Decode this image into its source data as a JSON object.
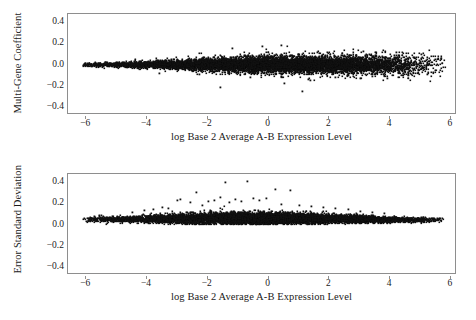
{
  "figure": {
    "background": "#ffffff",
    "point_color": "#111111",
    "axis_color": "#8e8e8e"
  },
  "chart_data": [
    {
      "type": "scatter",
      "panel": "top",
      "title": "",
      "xlabel": "log Base 2 Average A-B Expression Level",
      "ylabel": "Multi-Gene Coefficient",
      "xlim": [
        -6.6,
        6.2
      ],
      "ylim": [
        -0.47,
        0.47
      ],
      "xticks": [
        -6,
        -4,
        -2,
        0,
        2,
        4,
        6
      ],
      "xticklabels": [
        "−6",
        "−4",
        "−2",
        "0",
        "2",
        "4",
        "6"
      ],
      "yticks": [
        -0.4,
        -0.2,
        0.0,
        0.2,
        0.4
      ],
      "yticklabels": [
        "−0.4",
        "−0.2",
        "0.0",
        "0.2",
        "0.4"
      ],
      "grid": false,
      "legend": false,
      "n_points": 9000,
      "description": "Dense horizontal cloud centred on y = 0, narrow at the left (x = -6) and broadening toward the middle and right; scatter spreads to roughly +/-0.15 near x = 1-4 with sparse outliers reaching -0.25 and +0.2.",
      "density_profile": {
        "x_min_data": -6.1,
        "x_max_data": 5.8,
        "center": 0.0,
        "spread_by_x": [
          {
            "x": -6.0,
            "sd": 0.009
          },
          {
            "x": -5.0,
            "sd": 0.012
          },
          {
            "x": -4.0,
            "sd": 0.016
          },
          {
            "x": -3.0,
            "sd": 0.021
          },
          {
            "x": -2.0,
            "sd": 0.028
          },
          {
            "x": -1.0,
            "sd": 0.034
          },
          {
            "x": 0.0,
            "sd": 0.038
          },
          {
            "x": 1.0,
            "sd": 0.04
          },
          {
            "x": 2.0,
            "sd": 0.041
          },
          {
            "x": 3.0,
            "sd": 0.042
          },
          {
            "x": 4.0,
            "sd": 0.046
          },
          {
            "x": 5.0,
            "sd": 0.05
          },
          {
            "x": 5.8,
            "sd": 0.052
          }
        ],
        "x_weight_by_x": [
          {
            "x": -6.0,
            "w": 0.1
          },
          {
            "x": -5.0,
            "w": 0.22
          },
          {
            "x": -4.0,
            "w": 0.4
          },
          {
            "x": -3.0,
            "w": 0.58
          },
          {
            "x": -2.0,
            "w": 0.82
          },
          {
            "x": -1.0,
            "w": 1.0
          },
          {
            "x": 0.0,
            "w": 1.0
          },
          {
            "x": 1.0,
            "w": 0.95
          },
          {
            "x": 2.0,
            "w": 0.85
          },
          {
            "x": 3.0,
            "w": 0.72
          },
          {
            "x": 4.0,
            "w": 0.4
          },
          {
            "x": 5.0,
            "w": 0.14
          },
          {
            "x": 5.8,
            "w": 0.04
          }
        ],
        "outliers": [
          {
            "x": -3.6,
            "y": -0.075
          },
          {
            "x": -2.3,
            "y": -0.085
          },
          {
            "x": -1.6,
            "y": -0.205
          },
          {
            "x": -1.2,
            "y": 0.155
          },
          {
            "x": -0.6,
            "y": -0.115
          },
          {
            "x": -0.2,
            "y": 0.175
          },
          {
            "x": 0.4,
            "y": 0.185
          },
          {
            "x": 0.5,
            "y": -0.175
          },
          {
            "x": 1.1,
            "y": -0.245
          },
          {
            "x": 1.3,
            "y": -0.135
          },
          {
            "x": 1.35,
            "y": -0.142
          },
          {
            "x": 1.6,
            "y": 0.12
          },
          {
            "x": 2.2,
            "y": -0.118
          },
          {
            "x": 2.6,
            "y": -0.102
          },
          {
            "x": 3.0,
            "y": -0.122
          },
          {
            "x": 3.1,
            "y": 0.128
          },
          {
            "x": 3.4,
            "y": -0.108
          },
          {
            "x": 3.9,
            "y": -0.125
          },
          {
            "x": 4.2,
            "y": 0.112
          },
          {
            "x": 4.6,
            "y": -0.098
          },
          {
            "x": 5.0,
            "y": 0.095
          },
          {
            "x": 5.2,
            "y": -0.088
          }
        ]
      }
    },
    {
      "type": "scatter",
      "panel": "bottom",
      "title": "",
      "xlabel": "log Base 2 Average A-B Expression Level",
      "ylabel": "Error Standard Deviation",
      "xlim": [
        -6.6,
        6.2
      ],
      "ylim": [
        -0.47,
        0.47
      ],
      "xticks": [
        -6,
        -4,
        -2,
        0,
        2,
        4,
        6
      ],
      "xticklabels": [
        "−6",
        "−4",
        "−2",
        "0",
        "2",
        "4",
        "6"
      ],
      "yticks": [
        -0.4,
        -0.2,
        0.0,
        0.2,
        0.4
      ],
      "yticklabels": [
        "−0.4",
        "−0.2",
        "0.0",
        "0.2",
        "0.4"
      ],
      "grid": false,
      "legend": false,
      "n_points": 9000,
      "description": "Dense band of strictly positive values hugging y = 0.04-0.06 across the full x range, with an asymmetric upward tail of outliers reaching 0.2-0.4 concentrated between x = -3 and x = 1; band narrows and drops slightly toward x = 5.",
      "density_profile": {
        "x_min_data": -6.1,
        "x_max_data": 5.8,
        "baseline_by_x": [
          {
            "x": -6.0,
            "y": 0.048
          },
          {
            "x": -5.0,
            "y": 0.05
          },
          {
            "x": -4.0,
            "y": 0.052
          },
          {
            "x": -3.0,
            "y": 0.055
          },
          {
            "x": -2.0,
            "y": 0.058
          },
          {
            "x": -1.0,
            "y": 0.06
          },
          {
            "x": 0.0,
            "y": 0.06
          },
          {
            "x": 1.0,
            "y": 0.058
          },
          {
            "x": 2.0,
            "y": 0.055
          },
          {
            "x": 3.0,
            "y": 0.052
          },
          {
            "x": 4.0,
            "y": 0.048
          },
          {
            "x": 5.0,
            "y": 0.044
          },
          {
            "x": 5.8,
            "y": 0.042
          }
        ],
        "spread_by_x": [
          {
            "x": -6.0,
            "sd": 0.01
          },
          {
            "x": -5.0,
            "sd": 0.013
          },
          {
            "x": -4.0,
            "sd": 0.017
          },
          {
            "x": -3.0,
            "sd": 0.022
          },
          {
            "x": -2.0,
            "sd": 0.026
          },
          {
            "x": -1.0,
            "sd": 0.028
          },
          {
            "x": 0.0,
            "sd": 0.027
          },
          {
            "x": 1.0,
            "sd": 0.024
          },
          {
            "x": 2.0,
            "sd": 0.02
          },
          {
            "x": 3.0,
            "sd": 0.016
          },
          {
            "x": 4.0,
            "sd": 0.013
          },
          {
            "x": 5.0,
            "sd": 0.011
          },
          {
            "x": 5.8,
            "sd": 0.01
          }
        ],
        "x_weight_by_x": [
          {
            "x": -6.0,
            "w": 0.1
          },
          {
            "x": -5.0,
            "w": 0.22
          },
          {
            "x": -4.0,
            "w": 0.4
          },
          {
            "x": -3.0,
            "w": 0.58
          },
          {
            "x": -2.0,
            "w": 0.82
          },
          {
            "x": -1.0,
            "w": 1.0
          },
          {
            "x": 0.0,
            "w": 1.0
          },
          {
            "x": 1.0,
            "w": 0.95
          },
          {
            "x": 2.0,
            "w": 0.85
          },
          {
            "x": 3.0,
            "w": 0.72
          },
          {
            "x": 4.0,
            "w": 0.4
          },
          {
            "x": 5.0,
            "w": 0.14
          },
          {
            "x": 5.8,
            "w": 0.04
          }
        ],
        "outliers": [
          {
            "x": -5.75,
            "y": 0.075
          },
          {
            "x": -5.5,
            "y": 0.085
          },
          {
            "x": -4.5,
            "y": 0.12
          },
          {
            "x": -4.1,
            "y": 0.135
          },
          {
            "x": -3.8,
            "y": 0.145
          },
          {
            "x": -3.5,
            "y": 0.165
          },
          {
            "x": -3.3,
            "y": 0.155
          },
          {
            "x": -3.0,
            "y": 0.225
          },
          {
            "x": -2.9,
            "y": 0.238
          },
          {
            "x": -2.6,
            "y": 0.205
          },
          {
            "x": -2.4,
            "y": 0.3
          },
          {
            "x": -2.2,
            "y": 0.18
          },
          {
            "x": -2.0,
            "y": 0.215
          },
          {
            "x": -1.8,
            "y": 0.225
          },
          {
            "x": -1.6,
            "y": 0.255
          },
          {
            "x": -1.45,
            "y": 0.395
          },
          {
            "x": -1.3,
            "y": 0.205
          },
          {
            "x": -1.1,
            "y": 0.235
          },
          {
            "x": -0.9,
            "y": 0.215
          },
          {
            "x": -0.7,
            "y": 0.405
          },
          {
            "x": -0.5,
            "y": 0.245
          },
          {
            "x": -0.3,
            "y": 0.225
          },
          {
            "x": -0.1,
            "y": 0.25
          },
          {
            "x": 0.2,
            "y": 0.33
          },
          {
            "x": 0.4,
            "y": 0.195
          },
          {
            "x": 0.7,
            "y": 0.32
          },
          {
            "x": 1.0,
            "y": 0.185
          },
          {
            "x": 1.4,
            "y": 0.175
          },
          {
            "x": 1.8,
            "y": 0.165
          },
          {
            "x": 2.2,
            "y": 0.15
          },
          {
            "x": 2.6,
            "y": 0.14
          },
          {
            "x": 3.0,
            "y": 0.13
          },
          {
            "x": 3.4,
            "y": 0.12
          },
          {
            "x": 3.8,
            "y": 0.11
          }
        ]
      }
    }
  ]
}
